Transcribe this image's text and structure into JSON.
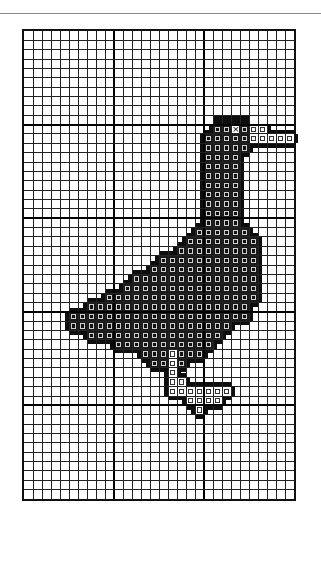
{
  "figure": {
    "grid": {
      "cols": 30,
      "rows": 50,
      "major_every": 10
    },
    "colors": {
      "grid": "#222222",
      "stitch": "#111111",
      "stitch_border": "#cfcfcf",
      "background": "#ffffff"
    },
    "stitch_rows": [
      {
        "row": 10,
        "from": 21,
        "to": 24
      },
      {
        "row": 11,
        "from": 20,
        "to": 24
      },
      {
        "row": 12,
        "from": 20,
        "to": 24
      },
      {
        "row": 13,
        "from": 20,
        "to": 23
      },
      {
        "row": 14,
        "from": 20,
        "to": 23
      },
      {
        "row": 15,
        "from": 20,
        "to": 23
      },
      {
        "row": 16,
        "from": 20,
        "to": 23
      },
      {
        "row": 17,
        "from": 20,
        "to": 23
      },
      {
        "row": 18,
        "from": 20,
        "to": 23
      },
      {
        "row": 19,
        "from": 20,
        "to": 23
      },
      {
        "row": 20,
        "from": 20,
        "to": 23
      },
      {
        "row": 21,
        "from": 19,
        "to": 24
      },
      {
        "row": 22,
        "from": 18,
        "to": 25
      },
      {
        "row": 23,
        "from": 17,
        "to": 25
      },
      {
        "row": 24,
        "from": 15,
        "to": 25
      },
      {
        "row": 25,
        "from": 14,
        "to": 25
      },
      {
        "row": 26,
        "from": 12,
        "to": 25
      },
      {
        "row": 27,
        "from": 11,
        "to": 25
      },
      {
        "row": 28,
        "from": 9,
        "to": 25
      },
      {
        "row": 29,
        "from": 7,
        "to": 24
      },
      {
        "row": 30,
        "from": 5,
        "to": 24
      },
      {
        "row": 31,
        "from": 5,
        "to": 22
      },
      {
        "row": 32,
        "from": 7,
        "to": 21
      },
      {
        "row": 33,
        "from": 10,
        "to": 20
      },
      {
        "row": 34,
        "from": 13,
        "to": 19
      },
      {
        "row": 35,
        "from": 14,
        "to": 17
      }
    ],
    "outline_cells": [
      [
        9,
        21
      ],
      [
        9,
        22
      ],
      [
        9,
        23
      ],
      [
        9,
        24
      ]
    ],
    "light_cells": [
      [
        10,
        25
      ],
      [
        10,
        26
      ],
      [
        11,
        25
      ],
      [
        11,
        26
      ],
      [
        11,
        27
      ],
      [
        11,
        28
      ],
      [
        11,
        29
      ],
      [
        34,
        16
      ],
      [
        35,
        16
      ],
      [
        36,
        16
      ],
      [
        37,
        16
      ],
      [
        37,
        17
      ],
      [
        38,
        16
      ],
      [
        38,
        17
      ],
      [
        38,
        18
      ],
      [
        38,
        19
      ],
      [
        38,
        20
      ],
      [
        38,
        21
      ],
      [
        38,
        22
      ],
      [
        39,
        18
      ],
      [
        39,
        19
      ],
      [
        39,
        20
      ],
      [
        39,
        21
      ],
      [
        40,
        19
      ]
    ],
    "eye_cell": [
      10,
      23
    ]
  }
}
